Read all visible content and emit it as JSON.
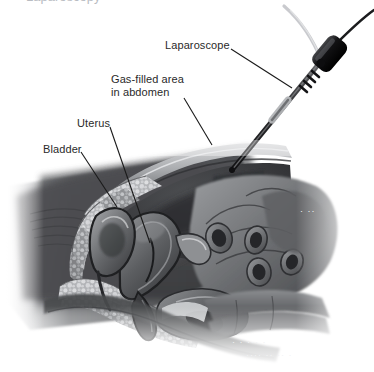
{
  "figure": {
    "title": "Laparoscopy",
    "width": 374,
    "height": 372,
    "background": "#ffffff"
  },
  "cropped_heading": {
    "text": "Laparoscopy",
    "note": "cut off at top edge of image"
  },
  "labels": [
    {
      "id": "laparoscope",
      "text": "Laparoscope",
      "x": 165,
      "y": 39,
      "leader": {
        "from_x": 231,
        "from_y": 49,
        "to_x": 292,
        "to_y": 88
      }
    },
    {
      "id": "gas-filled-area",
      "line1": "Gas-filled area",
      "line2": "in abdomen",
      "text": "Gas-filled area in abdomen",
      "x": 111,
      "y": 73,
      "leader": {
        "from_x": 184,
        "from_y": 98,
        "to_x": 212,
        "to_y": 145
      }
    },
    {
      "id": "uterus",
      "text": "Uterus",
      "x": 77,
      "y": 117,
      "leader": {
        "from_x": 110,
        "from_y": 127,
        "to_x": 150,
        "to_y": 243
      }
    },
    {
      "id": "bladder",
      "text": "Bladder",
      "x": 43,
      "y": 143,
      "leader": {
        "from_x": 81,
        "from_y": 152,
        "to_x": 117,
        "to_y": 207
      }
    }
  ],
  "colors": {
    "ink": "#2a2a2a",
    "leader_line": "#1a1a1a",
    "torso_dark": "#4a4b4d",
    "abdomen_cavity": "#3c3d40",
    "tissue_mid": "#6e7073",
    "tissue_light": "#b9bbbe",
    "fat_speckle": "#d5d6d8",
    "scope_body": "#1d1d1f",
    "scope_shaft": "#3a3b3d",
    "cable_light": "#c9cace",
    "page_white": "#ffffff"
  },
  "artwork": {
    "style": "grayscale airbrush medical illustration",
    "view": "sagittal mid-section of female pelvis, lateral view",
    "structures": [
      "anterior abdominal wall",
      "gas-filled (insufflated) peritoneal cavity",
      "uterus",
      "bladder",
      "vagina",
      "rectum",
      "small intestine loops",
      "sacrum and spinal column",
      "subcutaneous fat layer",
      "thigh and torso silhouette"
    ],
    "instrument": {
      "name": "laparoscope",
      "entry": "through anterior abdominal wall",
      "parts": [
        "shaft",
        "trocar sleeve",
        "handpiece connector",
        "light cable",
        "signal cable"
      ]
    }
  },
  "bleed_through": {
    "visible": true,
    "note": "faint reverse-side print showing through the page",
    "fragments": [
      "·  ·  ··· ·",
      "···· ·· ··  ·",
      "· ··"
    ]
  }
}
